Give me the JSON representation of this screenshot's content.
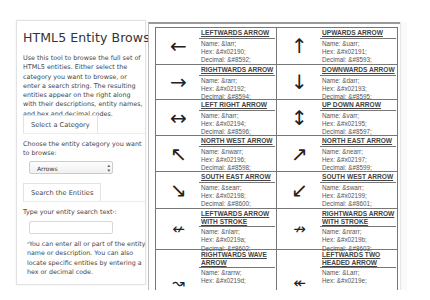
{
  "sidebar": {
    "title": "HTML5 Entity Browser",
    "intro": "Use this tool to browse the full set of HTML5 entities. Either select the category you want to browse, or enter a search string. The resulting entities appear on the right along with their descriptions, entity names, and hex and decimal codes.",
    "category_tab": "Select a Category",
    "category_label": "Choose the entity category you want to browse:",
    "category_selected": "Arrows",
    "search_tab": "Search the Entities",
    "search_label": "Type your entity search text",
    "search_label_mark": "*",
    "search_value": "",
    "note_mark": "*",
    "note": "You can enter all or part of the entity name or description. You can also locate specific entities by entering a hex or decimal code."
  },
  "entities": [
    {
      "symbol": "←",
      "icon": "leftwards-arrow-icon",
      "name": "LEFTWARDS ARROW",
      "entity": "Name: &larr;",
      "hex": "Hex: &#x02190;",
      "decimal": "Decimal: &#8592;"
    },
    {
      "symbol": "↑",
      "icon": "upwards-arrow-icon",
      "name": "UPWARDS ARROW",
      "entity": "Name: &uarr;",
      "hex": "Hex: &#x02191;",
      "decimal": "Decimal: &#8593;"
    },
    {
      "symbol": "→",
      "icon": "rightwards-arrow-icon",
      "name": "RIGHTWARDS ARROW",
      "entity": "Name: &rarr;",
      "hex": "Hex: &#x02192;",
      "decimal": "Decimal: &#8594;"
    },
    {
      "symbol": "↓",
      "icon": "downwards-arrow-icon",
      "name": "DOWNWARDS ARROW",
      "entity": "Name: &darr;",
      "hex": "Hex: &#x02193;",
      "decimal": "Decimal: &#8595;"
    },
    {
      "symbol": "↔",
      "icon": "left-right-arrow-icon",
      "name": "LEFT RIGHT ARROW",
      "entity": "Name: &harr;",
      "hex": "Hex: &#x02194;",
      "decimal": "Decimal: &#8596;"
    },
    {
      "symbol": "↕",
      "icon": "up-down-arrow-icon",
      "name": "UP DOWN ARROW",
      "entity": "Name: &varr;",
      "hex": "Hex: &#x02195;",
      "decimal": "Decimal: &#8597;"
    },
    {
      "symbol": "↖",
      "icon": "north-west-arrow-icon",
      "name": "NORTH WEST ARROW",
      "entity": "Name: &nwarr;",
      "hex": "Hex: &#x02196;",
      "decimal": "Decimal: &#8598;"
    },
    {
      "symbol": "↗",
      "icon": "north-east-arrow-icon",
      "name": "NORTH EAST ARROW",
      "entity": "Name: &nearr;",
      "hex": "Hex: &#x02197;",
      "decimal": "Decimal: &#8599;"
    },
    {
      "symbol": "↘",
      "icon": "south-east-arrow-icon",
      "name": "SOUTH EAST ARROW",
      "entity": "Name: &searr;",
      "hex": "Hex: &#x02198;",
      "decimal": "Decimal: &#8600;"
    },
    {
      "symbol": "↙",
      "icon": "south-west-arrow-icon",
      "name": "SOUTH WEST ARROW",
      "entity": "Name: &swarr;",
      "hex": "Hex: &#x02199;",
      "decimal": "Decimal: &#8601;"
    },
    {
      "symbol": "↚",
      "icon": "leftwards-arrow-with-stroke-icon",
      "name": "LEFTWARDS ARROW WITH STROKE",
      "entity": "Name: &nlarr;",
      "hex": "Hex: &#x0219a;",
      "decimal": "Decimal: &#8602;"
    },
    {
      "symbol": "↛",
      "icon": "rightwards-arrow-with-stroke-icon",
      "name": "RIGHTWARDS ARROW WITH STROKE",
      "entity": "Name: &nrarr;",
      "hex": "Hex: &#x0219b;",
      "decimal": "Decimal: &#8603;"
    },
    {
      "symbol": "↝",
      "icon": "rightwards-wave-arrow-icon",
      "name": "RIGHTWARDS WAVE ARROW",
      "entity": "Name: &rarrw;",
      "hex": "Hex: &#x0219d;",
      "decimal": ""
    },
    {
      "symbol": "↞",
      "icon": "leftwards-two-headed-arrow-icon",
      "name": "LEFTWARDS TWO HEADED ARROW",
      "entity": "Name: &Larr;",
      "hex": "Hex: &#x0219e;",
      "decimal": ""
    }
  ]
}
